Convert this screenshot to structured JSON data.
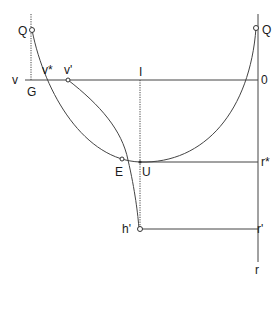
{
  "diagram": {
    "labels": {
      "Q_left": "Q",
      "Q_right": "Q",
      "v": "v",
      "G": "G",
      "v_star": "v*",
      "v_prime": "v'",
      "I": "I",
      "zero": "0",
      "E": "E",
      "U": "U",
      "r_star": "r*",
      "h_prime": "h'",
      "r_prime": "r'",
      "r": "r"
    }
  }
}
